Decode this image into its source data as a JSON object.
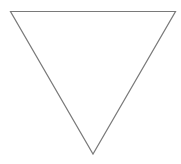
{
  "diagram": {
    "shape": "inverted-triangle",
    "background": "#ffffff",
    "fill": "#ffffff",
    "stroke": "#7a7a7a",
    "stroke_width": 1.2,
    "points": "10.5,11.5 175.5,11.5 93,154"
  }
}
